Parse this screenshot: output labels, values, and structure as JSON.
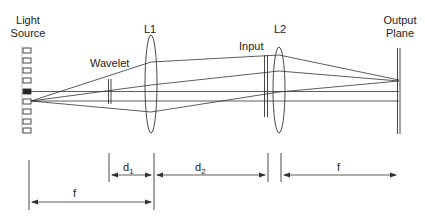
{
  "diagram": {
    "title": "",
    "labels": {
      "light_source_line1": "Light",
      "light_source_line2": "Source",
      "wavelet": "Wavelet",
      "lens1": "L1",
      "input": "Input",
      "lens2": "L2",
      "output_line1": "Output",
      "output_line2": "Plane"
    },
    "dimensions": {
      "d1_main": "d",
      "d1_sub": "1",
      "d2_main": "d",
      "d2_sub": "2",
      "f_left": "f",
      "f_right": "f"
    },
    "colors": {
      "stroke": "#333333",
      "background": "#ffffff"
    },
    "components": [
      {
        "name": "Light Source",
        "type": "source-array",
        "x": 26
      },
      {
        "name": "Wavelet",
        "type": "plane",
        "x": 110
      },
      {
        "name": "L1",
        "type": "lens",
        "x": 151
      },
      {
        "name": "Input",
        "type": "plane",
        "x": 266
      },
      {
        "name": "L2",
        "type": "lens",
        "x": 279
      },
      {
        "name": "Output Plane",
        "type": "plane",
        "x": 399
      }
    ]
  }
}
